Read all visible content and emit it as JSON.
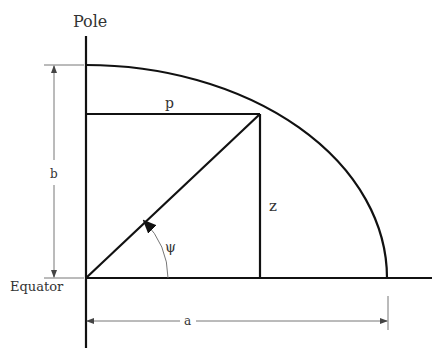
{
  "diagram": {
    "labels": {
      "pole": "Pole",
      "equator": "Equator",
      "p": "p",
      "z": "z",
      "b": "b",
      "a": "a",
      "psi": "ψ"
    },
    "geometry": {
      "origin": [
        86,
        278
      ],
      "semi_major_a_px": 301,
      "semi_minor_b_px": 213,
      "point": [
        260,
        114
      ]
    },
    "colors": {
      "stroke": "#111111",
      "dimension_stroke": "#666666",
      "text": "#333333",
      "background": "#ffffff"
    }
  }
}
